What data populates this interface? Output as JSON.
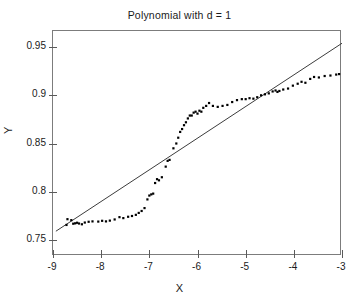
{
  "chart_data": {
    "type": "scatter",
    "title": "Polynomial with d = 1",
    "xlabel": "X",
    "ylabel": "Y",
    "xlim": [
      -9,
      -3
    ],
    "ylim": [
      0.7333,
      0.9667
    ],
    "grid": false,
    "legend": null,
    "xticks": [
      -9,
      -8,
      -7,
      -6,
      -5,
      -4,
      -3
    ],
    "xticklabels": [
      "-9",
      "-8",
      "-7",
      "-6",
      "-5",
      "-4",
      "-3"
    ],
    "yticks": [
      0.75,
      0.8,
      0.85,
      0.9,
      0.95
    ],
    "yticklabels": [
      "0.75",
      "0.8",
      "0.85",
      "0.9",
      "0.95"
    ],
    "series": [
      {
        "name": "data-points",
        "type": "scatter",
        "marker": "square",
        "marker_size": 2.2,
        "color": "#000000",
        "points": [
          [
            -8.72,
            0.7655
          ],
          [
            -8.7,
            0.7715
          ],
          [
            -8.62,
            0.7705
          ],
          [
            -8.58,
            0.7668
          ],
          [
            -8.54,
            0.7672
          ],
          [
            -8.5,
            0.7678
          ],
          [
            -8.46,
            0.767
          ],
          [
            -8.4,
            0.7662
          ],
          [
            -8.34,
            0.768
          ],
          [
            -8.26,
            0.7688
          ],
          [
            -8.18,
            0.7692
          ],
          [
            -8.06,
            0.769
          ],
          [
            -7.98,
            0.7698
          ],
          [
            -7.9,
            0.7692
          ],
          [
            -7.82,
            0.77
          ],
          [
            -7.72,
            0.7712
          ],
          [
            -7.62,
            0.7736
          ],
          [
            -7.54,
            0.7726
          ],
          [
            -7.44,
            0.774
          ],
          [
            -7.36,
            0.7748
          ],
          [
            -7.28,
            0.776
          ],
          [
            -7.22,
            0.778
          ],
          [
            -7.16,
            0.78
          ],
          [
            -7.1,
            0.783
          ],
          [
            -7.04,
            0.792
          ],
          [
            -7.0,
            0.796
          ],
          [
            -6.96,
            0.7972
          ],
          [
            -6.92,
            0.798
          ],
          [
            -6.88,
            0.809
          ],
          [
            -6.84,
            0.813
          ],
          [
            -6.8,
            0.8118
          ],
          [
            -6.74,
            0.815
          ],
          [
            -6.66,
            0.826
          ],
          [
            -6.62,
            0.832
          ],
          [
            -6.58,
            0.833
          ],
          [
            -6.5,
            0.845
          ],
          [
            -6.44,
            0.85
          ],
          [
            -6.4,
            0.856
          ],
          [
            -6.36,
            0.862
          ],
          [
            -6.32,
            0.865
          ],
          [
            -6.28,
            0.869
          ],
          [
            -6.24,
            0.872
          ],
          [
            -6.2,
            0.876
          ],
          [
            -6.16,
            0.879
          ],
          [
            -6.12,
            0.879
          ],
          [
            -6.08,
            0.882
          ],
          [
            -6.04,
            0.883
          ],
          [
            -6.0,
            0.881
          ],
          [
            -5.96,
            0.884
          ],
          [
            -5.92,
            0.883
          ],
          [
            -5.88,
            0.887
          ],
          [
            -5.82,
            0.889
          ],
          [
            -5.76,
            0.892
          ],
          [
            -5.68,
            0.889
          ],
          [
            -5.58,
            0.888
          ],
          [
            -5.48,
            0.889
          ],
          [
            -5.38,
            0.89
          ],
          [
            -5.28,
            0.893
          ],
          [
            -5.18,
            0.895
          ],
          [
            -5.08,
            0.896
          ],
          [
            -5.0,
            0.896
          ],
          [
            -4.92,
            0.897
          ],
          [
            -4.84,
            0.8965
          ],
          [
            -4.76,
            0.898
          ],
          [
            -4.68,
            0.9
          ],
          [
            -4.6,
            0.901
          ],
          [
            -4.52,
            0.902
          ],
          [
            -4.44,
            0.904
          ],
          [
            -4.38,
            0.905
          ],
          [
            -4.34,
            0.9035
          ],
          [
            -4.3,
            0.9045
          ],
          [
            -4.22,
            0.906
          ],
          [
            -4.12,
            0.907
          ],
          [
            -4.02,
            0.91
          ],
          [
            -3.92,
            0.912
          ],
          [
            -3.84,
            0.914
          ],
          [
            -3.76,
            0.913
          ],
          [
            -3.66,
            0.917
          ],
          [
            -3.58,
            0.919
          ],
          [
            -3.48,
            0.9185
          ],
          [
            -3.36,
            0.92
          ],
          [
            -3.24,
            0.9205
          ],
          [
            -3.12,
            0.9215
          ],
          [
            -3.06,
            0.922
          ]
        ]
      },
      {
        "name": "degree-1-fit-line",
        "type": "line",
        "color": "#3c3c3c",
        "linewidth": 1,
        "endpoints": [
          [
            -8.94,
            0.759
          ],
          [
            -3.0,
            0.954
          ]
        ]
      }
    ]
  }
}
